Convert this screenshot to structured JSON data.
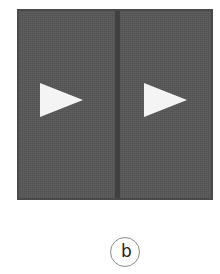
{
  "figure": {
    "panel": {
      "color": "#585858",
      "divider_color": "#404040",
      "cells": [
        {
          "icon": "play-triangle-icon",
          "color": "#f4f4f4"
        },
        {
          "icon": "play-triangle-icon",
          "color": "#f4f4f4"
        }
      ]
    },
    "label": "b"
  }
}
